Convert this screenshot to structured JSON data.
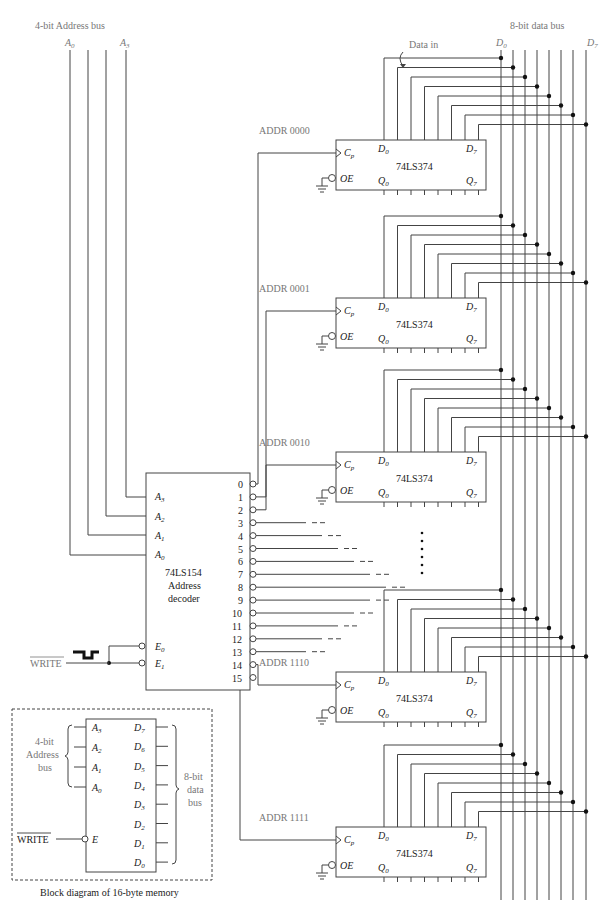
{
  "figure": {
    "address_bus_label": "4-bit Address bus",
    "address_bus_ends": [
      "A0",
      "A3"
    ],
    "data_bus_label": "8-bit data bus",
    "data_bus_ends": [
      "D0",
      "D7"
    ],
    "data_in_label": "Data in"
  },
  "registers": [
    {
      "addr": "ADDR 0000",
      "chip": "74LS374",
      "decoder_output": 0
    },
    {
      "addr": "ADDR 0001",
      "chip": "74LS374",
      "decoder_output": 1
    },
    {
      "addr": "ADDR 0010",
      "chip": "74LS374",
      "decoder_output": 2
    },
    {
      "addr": "ADDR 1110",
      "chip": "74LS374",
      "decoder_output": 14
    },
    {
      "addr": "ADDR 1111",
      "chip": "74LS374",
      "decoder_output": 15
    }
  ],
  "register_pins": {
    "clock": "Cp",
    "output_enable": "OE",
    "d_first": "D0",
    "d_last": "D7",
    "q_first": "Q0",
    "q_last": "Q7"
  },
  "decoder": {
    "chip": "74LS154",
    "line2": "Address",
    "line3": "decoder",
    "inputs": [
      "A3",
      "A2",
      "A1",
      "A0"
    ],
    "enables": [
      "E0",
      "E1"
    ],
    "outputs": [
      "0",
      "1",
      "2",
      "3",
      "4",
      "5",
      "6",
      "7",
      "8",
      "9",
      "10",
      "11",
      "12",
      "13",
      "14",
      "15"
    ]
  },
  "write_signal": "WRITE",
  "block_diagram": {
    "caption": "Block diagram of 16-byte memory",
    "address_label": [
      "4-bit",
      "Address",
      "bus"
    ],
    "data_label": [
      "8-bit",
      "data",
      "bus"
    ],
    "address_pins": [
      "A3",
      "A2",
      "A1",
      "A0"
    ],
    "data_pins": [
      "D7",
      "D6",
      "D5",
      "D4",
      "D3",
      "D2",
      "D1",
      "D0"
    ],
    "enable_pin": "E",
    "write_label": "WRITE"
  }
}
